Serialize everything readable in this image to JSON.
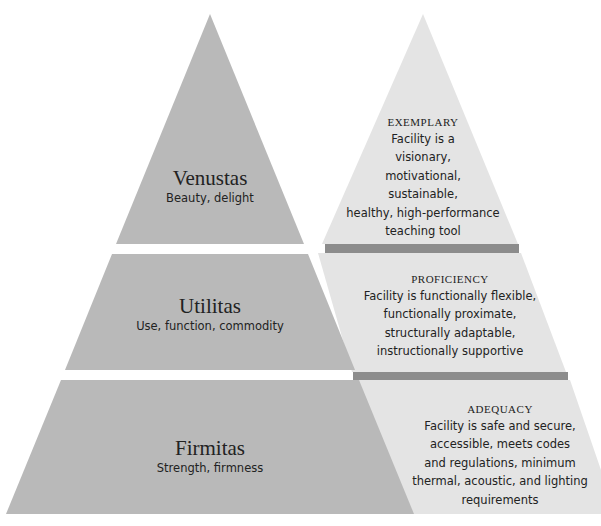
{
  "colors": {
    "left_band": "#b9b9b9",
    "right_face": "#e4e4e4",
    "divider_bar": "#8c8c8c",
    "background": "#ffffff",
    "text": "#222222"
  },
  "left_pyramid": {
    "bands": [
      {
        "title": "Venustas",
        "subtitle": "Beauty, delight"
      },
      {
        "title": "Utilitas",
        "subtitle": "Use, function, commodity"
      },
      {
        "title": "Firmitas",
        "subtitle": "Strength, firmness"
      }
    ]
  },
  "right_pyramid": {
    "levels": [
      {
        "heading": "EXEMPLARY",
        "description": "Facility is a\nvisionary,\nmotivational,\nsustainable,\nhealthy, high-performance\nteaching tool"
      },
      {
        "heading": "PROFICIENCY",
        "description": "Facility is functionally flexible,\nfunctionally proximate,\nstructurally adaptable,\ninstructionally supportive"
      },
      {
        "heading": "ADEQUACY",
        "description": "Facility is safe and secure,\naccessible, meets codes\nand regulations, minimum\nthermal, acoustic, and lighting\nrequirements"
      }
    ]
  }
}
